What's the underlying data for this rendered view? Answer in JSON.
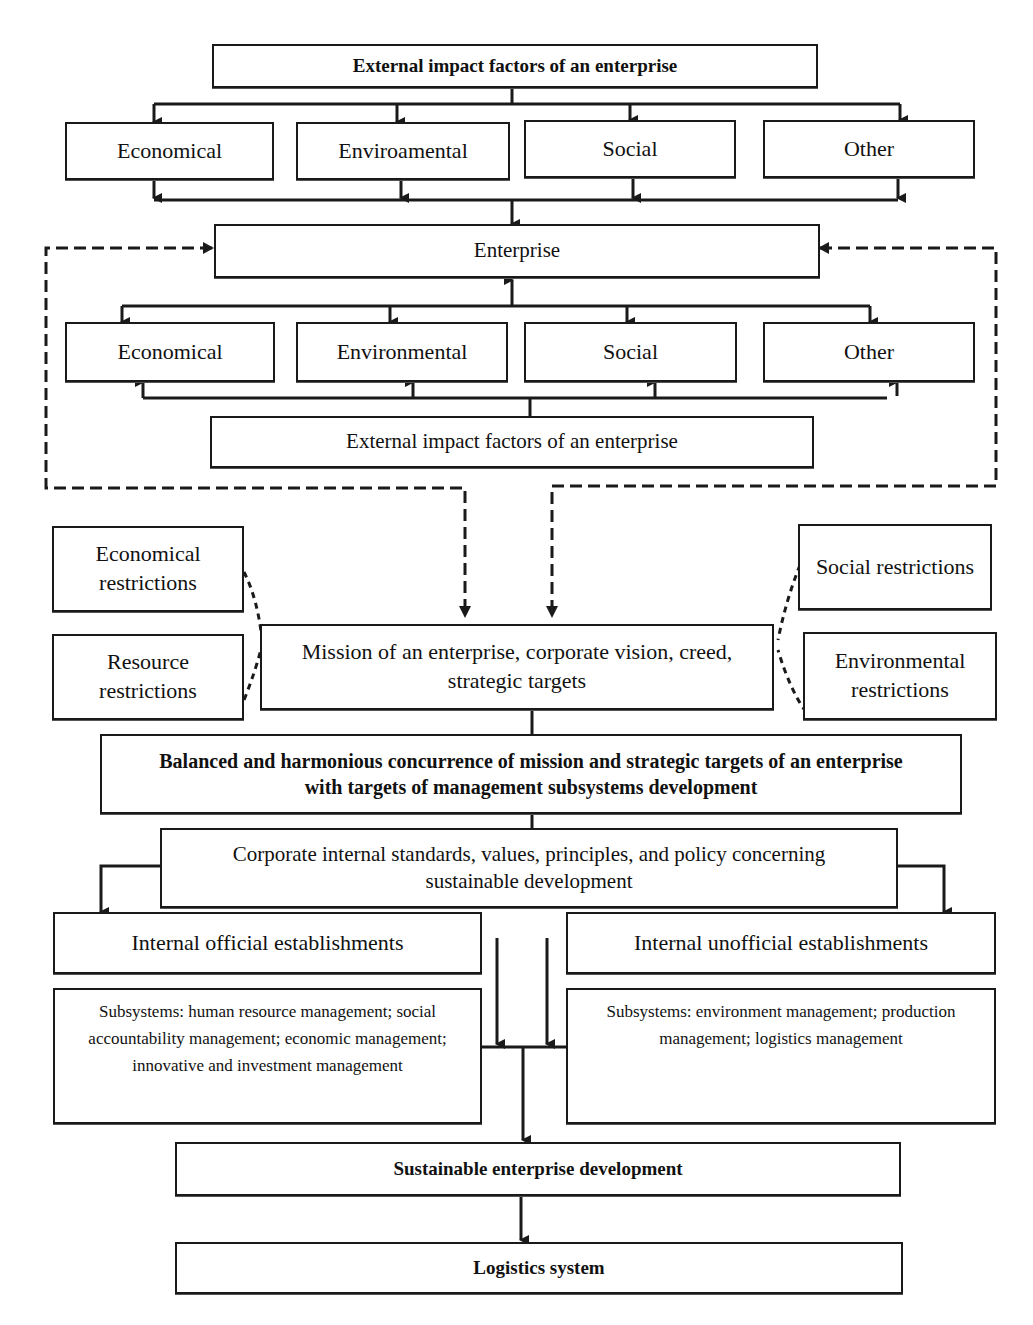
{
  "diagram": {
    "top_block": {
      "header": "External impact factors of an enterprise",
      "factors": [
        "Economical",
        "Enviroamental",
        "Social",
        "Other"
      ]
    },
    "enterprise_block": {
      "enterprise": "Enterprise",
      "factors": [
        "Economical",
        "Environmental",
        "Social",
        "Other"
      ],
      "footer": "External impact factors of an enterprise"
    },
    "restrictions": {
      "economical": "Economical restrictions",
      "resource": "Resource restrictions",
      "social": "Social restrictions",
      "environmental": "Environmental restrictions"
    },
    "mission": "Mission of an enterprise, corporate vision, creed, strategic targets",
    "balanced": "Balanced and harmonious concurrence of mission and strategic targets of an enterprise with targets of management subsystems development",
    "corporate_standards": "Corporate internal standards, values, principles, and policy concerning sustainable development",
    "establishments": {
      "official": "Internal official establishments",
      "unofficial": "Internal unofficial establishments"
    },
    "subsystems": {
      "left": "Subsystems: human resource management; social accountability management; economic management; innovative and investment management",
      "right": "Subsystems: environment management; production management; logistics management"
    },
    "sustainable": "Sustainable enterprise development",
    "logistics": "Logistics system"
  },
  "colors": {
    "line": "#1a1a1a",
    "background": "#ffffff"
  }
}
